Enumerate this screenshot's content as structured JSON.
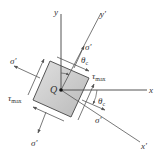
{
  "diagram": {
    "type": "stress-element-rotated",
    "origin_label": "Q",
    "axes": {
      "x": "x",
      "y": "y",
      "x_prime": "x'",
      "y_prime": "y'"
    },
    "angle_label": "θc",
    "angle_sub": "c",
    "normal_stress_label": "σ'",
    "shear_stress_label": "τ",
    "shear_stress_sub": "max",
    "colors": {
      "element_fill": "#c9c9c9",
      "line": "#555555",
      "text": "#333333"
    }
  }
}
